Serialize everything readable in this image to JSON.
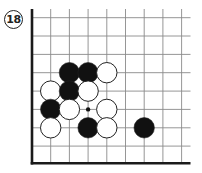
{
  "problem": {
    "number": "18"
  },
  "board": {
    "grid": {
      "x_lines": [
        32,
        50.7,
        69.4,
        88.1,
        106.8,
        125.5,
        144.2,
        162.9,
        181.6
      ],
      "y_lines": [
        17.7,
        36,
        54.4,
        72.7,
        91.1,
        109.4,
        127.8,
        146.1,
        163.3
      ],
      "x_extent": [
        32,
        190.5
      ],
      "y_extent": [
        9,
        163.3
      ],
      "line_color": "#8a8a8a",
      "edge_color": "#1a1a1a",
      "open_edges": [
        "top",
        "right"
      ],
      "solid_edges": [
        "left",
        "bottom"
      ]
    },
    "stone_radius": 10.2,
    "stones": [
      {
        "color": "black",
        "col": 2,
        "row": 3
      },
      {
        "color": "black",
        "col": 3,
        "row": 3
      },
      {
        "color": "white",
        "col": 4,
        "row": 3
      },
      {
        "color": "white",
        "col": 1,
        "row": 4
      },
      {
        "color": "black",
        "col": 2,
        "row": 4
      },
      {
        "color": "white",
        "col": 3,
        "row": 4
      },
      {
        "color": "black",
        "col": 1,
        "row": 5
      },
      {
        "color": "white",
        "col": 2,
        "row": 5
      },
      {
        "color": "white",
        "col": 4,
        "row": 5
      },
      {
        "color": "white",
        "col": 1,
        "row": 6
      },
      {
        "color": "black",
        "col": 3,
        "row": 6
      },
      {
        "color": "white",
        "col": 4,
        "row": 6
      },
      {
        "color": "black",
        "col": 6,
        "row": 6
      }
    ],
    "markers": [
      {
        "type": "dot",
        "col": 3,
        "row": 5,
        "radius": 2.2
      }
    ],
    "colors": {
      "black_stone": "#111111",
      "white_stone": "#ffffff",
      "stone_outline": "#222222"
    }
  }
}
